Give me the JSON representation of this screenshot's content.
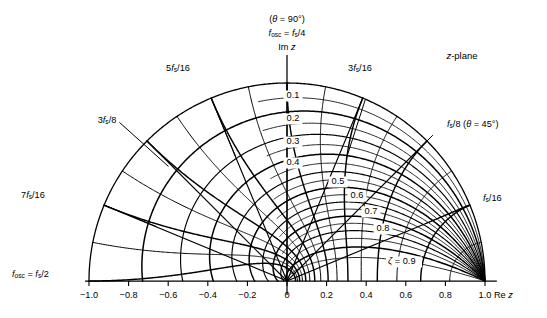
{
  "figure": {
    "name": "z-plane-root-locus-grid",
    "plane_label": "z-plane",
    "top_annotation": {
      "line1": "(θ = 90°)",
      "line2_pre": "f",
      "line2_sub": "osc",
      "line2_mid": " = ",
      "line2_f": "f",
      "line2_fsub": "s",
      "line2_post": "/4",
      "line3": "Im z"
    },
    "left_annotation": {
      "pre": "f",
      "sub": "osc",
      "mid": " = ",
      "f": "f",
      "fsub": "s",
      "post": "/2"
    },
    "x_axis_label": "Re z",
    "colors": {
      "line": "#000000",
      "background": "#ffffff",
      "axis": "#000000"
    }
  },
  "chart_data": {
    "type": "line",
    "title": "z-plane",
    "xlabel": "Re z",
    "ylabel": "Im z",
    "xlim": [
      -1.0,
      1.0
    ],
    "ylim": [
      0.0,
      1.0
    ],
    "grid": false,
    "legend_position": "none",
    "x_ticks": [
      "-1.0",
      "-0.8",
      "-0.6",
      "-0.4",
      "-0.2",
      "0",
      "0.2",
      "0.4",
      "0.6",
      "0.8",
      "1.0"
    ],
    "x_tick_values": [
      -1.0,
      -0.8,
      -0.6,
      -0.4,
      -0.2,
      0.0,
      0.2,
      0.4,
      0.6,
      0.8,
      1.0
    ],
    "zeta_series": {
      "name": "constant damping ratio ζ",
      "symbol": "ζ",
      "labels": [
        "0.1",
        "0.2",
        "0.3",
        "0.4",
        "0.5",
        "0.6",
        "0.7",
        "0.8",
        "0.9"
      ],
      "values": [
        0.1,
        0.2,
        0.3,
        0.4,
        0.5,
        0.6,
        0.7,
        0.8,
        0.9
      ],
      "last_label_prefix": "ζ = ",
      "label_positions": [
        {
          "value": "0.1",
          "x": 293,
          "y": 96
        },
        {
          "value": "0.2",
          "x": 293,
          "y": 119
        },
        {
          "value": "0.3",
          "x": 293,
          "y": 142
        },
        {
          "value": "0.4",
          "x": 293,
          "y": 163
        },
        {
          "value": "0.5",
          "x": 338,
          "y": 182
        },
        {
          "value": "0.6",
          "x": 357,
          "y": 196
        },
        {
          "value": "0.7",
          "x": 371,
          "y": 212
        },
        {
          "value": "0.8",
          "x": 383,
          "y": 229
        },
        {
          "value": "0.9",
          "x": 400,
          "y": 262
        }
      ]
    },
    "frequency_series": {
      "name": "constant frequency loci (fraction of sampling frequency)",
      "labels": [
        "f_s/16",
        "f_s/8",
        "3f_s/16",
        "f_s/4",
        "5f_s/16",
        "3f_s/8",
        "7f_s/16",
        "f_s/2"
      ],
      "normalized_values": [
        0.0625,
        0.125,
        0.1875,
        0.25,
        0.3125,
        0.375,
        0.4375,
        0.5
      ],
      "angles_deg": [
        22.5,
        45,
        67.5,
        90,
        112.5,
        135,
        157.5,
        180
      ],
      "callouts": [
        {
          "text": "5f s/16",
          "num": "5",
          "f": "f",
          "sub": "s",
          "den": "/16",
          "x": 178,
          "y": 66
        },
        {
          "text": "3f s/16",
          "num": "3",
          "f": "f",
          "sub": "s",
          "den": "/16",
          "x": 360,
          "y": 66
        },
        {
          "text": "3f s/8",
          "num": "3",
          "f": "f",
          "sub": "s",
          "den": "/8",
          "x": 107,
          "y": 118
        },
        {
          "text": "f s/8 (θ = 45°)",
          "num": "",
          "f": "f",
          "sub": "s",
          "den": "/8 (θ = 45°)",
          "x": 447,
          "y": 122
        },
        {
          "text": "7f s/16",
          "num": "7",
          "f": "f",
          "sub": "s",
          "den": "/16",
          "x": 21,
          "y": 193
        },
        {
          "text": "f s/16",
          "num": "",
          "f": "f",
          "sub": "s",
          "den": "/16",
          "x": 490,
          "y": 196
        }
      ]
    }
  },
  "labels": {
    "zeta_symbol": "ζ",
    "theta_symbol": "θ",
    "degree": "°"
  }
}
